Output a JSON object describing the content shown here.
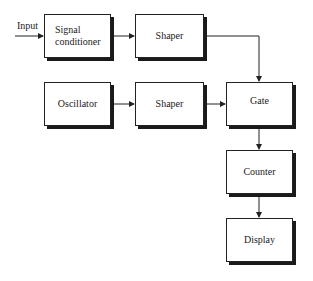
{
  "diagram": {
    "input_label": "Input",
    "blocks": {
      "signal_conditioner": "Signal conditioner",
      "shaper_top": "Shaper",
      "oscillator": "Oscillator",
      "shaper_mid": "Shaper",
      "gate": "Gate",
      "counter": "Counter",
      "display": "Display"
    },
    "connections": [
      {
        "from": "Input",
        "to": "Signal conditioner"
      },
      {
        "from": "Signal conditioner",
        "to": "Shaper (top)"
      },
      {
        "from": "Shaper (top)",
        "to": "Gate"
      },
      {
        "from": "Oscillator",
        "to": "Shaper (mid)"
      },
      {
        "from": "Shaper (mid)",
        "to": "Gate"
      },
      {
        "from": "Gate",
        "to": "Counter"
      },
      {
        "from": "Counter",
        "to": "Display"
      }
    ]
  }
}
